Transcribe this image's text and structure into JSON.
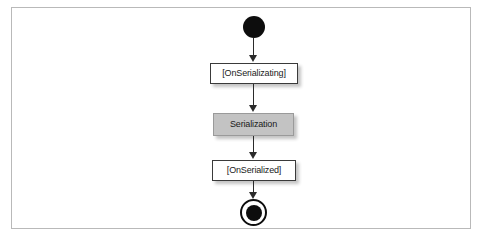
{
  "figure": {
    "frame_border_color": "#b9b9b9",
    "background_color": "#ffffff"
  },
  "diagram": {
    "type": "uml-activity-diagram",
    "orientation": "vertical",
    "nodes": [
      {
        "id": "initial",
        "kind": "initial-node",
        "label": "",
        "shape": "filled-circle",
        "color": "#0d0d0d"
      },
      {
        "id": "onserializating",
        "kind": "action",
        "label": "[OnSerializating]",
        "shape": "rectangle",
        "fill": "#ffffff",
        "border": "#3a3a3a"
      },
      {
        "id": "serialization",
        "kind": "state",
        "label": "Serialization",
        "shape": "rectangle",
        "fill": "#c3c3c3",
        "border": "#9a9a9a"
      },
      {
        "id": "onserialized",
        "kind": "action",
        "label": "[OnSerialized]",
        "shape": "rectangle",
        "fill": "#ffffff",
        "border": "#3a3a3a"
      },
      {
        "id": "final",
        "kind": "final-node",
        "label": "",
        "shape": "bullseye",
        "color": "#0d0d0d"
      }
    ],
    "edges": [
      {
        "id": "e1",
        "from": "initial",
        "to": "onserializating",
        "label": "",
        "arrow": "filled"
      },
      {
        "id": "e2",
        "from": "onserializating",
        "to": "serialization",
        "label": "",
        "arrow": "filled"
      },
      {
        "id": "e3",
        "from": "serialization",
        "to": "onserialized",
        "label": "",
        "arrow": "filled"
      },
      {
        "id": "e4",
        "from": "onserialized",
        "to": "final",
        "label": "",
        "arrow": "filled"
      }
    ]
  }
}
